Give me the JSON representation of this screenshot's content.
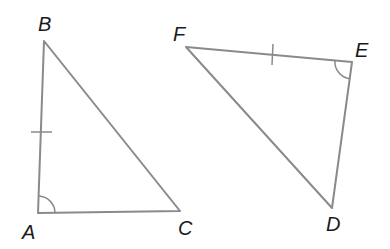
{
  "diagram": {
    "type": "congruent-triangles",
    "triangles": [
      {
        "name": "ABC",
        "vertices": [
          {
            "label": "A",
            "x": 38,
            "y": 213,
            "label_x": 30,
            "label_y": 238
          },
          {
            "label": "B",
            "x": 44,
            "y": 41,
            "label_x": 46,
            "label_y": 30
          },
          {
            "label": "C",
            "x": 180,
            "y": 211,
            "label_x": 186,
            "label_y": 235
          }
        ],
        "marked_side": "AB",
        "marked_angle": "A"
      },
      {
        "name": "DEF",
        "vertices": [
          {
            "label": "D",
            "x": 332,
            "y": 208,
            "label_x": 333,
            "label_y": 231
          },
          {
            "label": "E",
            "x": 352,
            "y": 62,
            "label_x": 361,
            "label_y": 56
          },
          {
            "label": "F",
            "x": 186,
            "y": 47,
            "label_x": 181,
            "label_y": 41
          }
        ],
        "marked_side": "FE",
        "marked_angle": "E"
      }
    ],
    "labels": {
      "A": "A",
      "B": "B",
      "C": "C",
      "D": "D",
      "E": "E",
      "F": "F"
    },
    "colors": {
      "stroke": "#8a8a8a",
      "label": "#1a1a1a",
      "background": "#ffffff"
    }
  }
}
